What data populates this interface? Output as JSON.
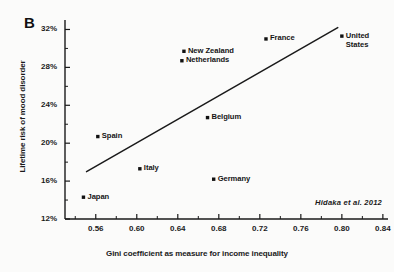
{
  "figure": {
    "panel_label": "B",
    "citation": "Hidaka et al.  2012",
    "background_color": "#fbfbfa",
    "ink_color": "#1a1a1a"
  },
  "chart_data": {
    "type": "scatter",
    "title": "",
    "xlabel": "Gini coefficient as measure for income inequality",
    "ylabel": "Lifetime risk of mood disorder",
    "xlim": [
      0.53,
      0.845
    ],
    "ylim": [
      12,
      33
    ],
    "grid": false,
    "legend": "none",
    "xticks": [
      0.56,
      0.6,
      0.64,
      0.68,
      0.72,
      0.76,
      0.8,
      0.84
    ],
    "xtick_labels": [
      "0.56",
      "0.60",
      "0.64",
      "0.68",
      "0.72",
      "0.76",
      "0.80",
      "0.84"
    ],
    "yticks": [
      12,
      16,
      20,
      24,
      28,
      32
    ],
    "ytick_labels": [
      "12%",
      "16%",
      "20%",
      "24%",
      "28%",
      "32%"
    ],
    "points": [
      {
        "label": "Japan",
        "x": 0.548,
        "y": 14.3,
        "label_pos": "right"
      },
      {
        "label": "Spain",
        "x": 0.562,
        "y": 20.7,
        "label_pos": "right"
      },
      {
        "label": "Italy",
        "x": 0.603,
        "y": 17.3,
        "label_pos": "right"
      },
      {
        "label": "Netherlands",
        "x": 0.644,
        "y": 28.7,
        "label_pos": "right"
      },
      {
        "label": "New Zealand",
        "x": 0.646,
        "y": 29.7,
        "label_pos": "right"
      },
      {
        "label": "Germany",
        "x": 0.675,
        "y": 16.2,
        "label_pos": "right"
      },
      {
        "label": "Belgium",
        "x": 0.669,
        "y": 22.7,
        "label_pos": "right"
      },
      {
        "label": "France",
        "x": 0.726,
        "y": 31.0,
        "label_pos": "right"
      },
      {
        "label": "United\nStates",
        "x": 0.8,
        "y": 31.3,
        "label_pos": "right"
      }
    ],
    "trendline": {
      "x_start": 0.551,
      "y_start": 17.0,
      "x_end": 0.796,
      "y_end": 32.2
    }
  }
}
